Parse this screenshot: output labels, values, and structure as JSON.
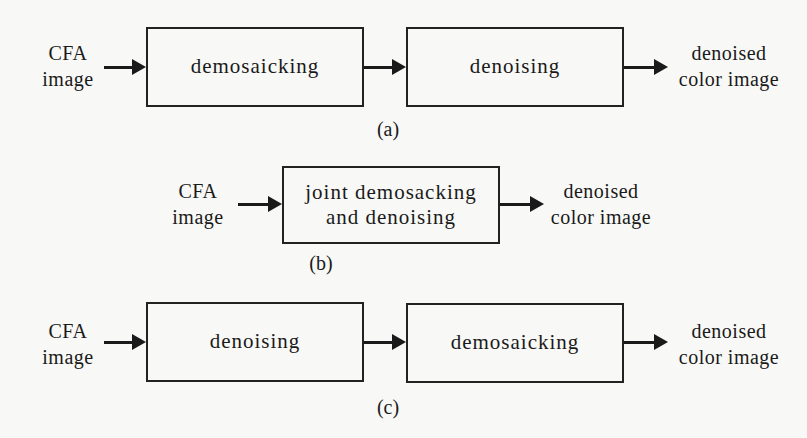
{
  "diagrams": {
    "a": {
      "input": {
        "line1": "CFA",
        "line2": "image"
      },
      "blocks": [
        "demosaicking",
        "denoising"
      ],
      "output": {
        "line1": "denoised",
        "line2": "color image"
      },
      "caption": "(a)"
    },
    "b": {
      "input": {
        "line1": "CFA",
        "line2": "image"
      },
      "blocks": [
        {
          "line1": "joint demosacking",
          "line2": "and denoising"
        }
      ],
      "output": {
        "line1": "denoised",
        "line2": "color image"
      },
      "caption": "(b)"
    },
    "c": {
      "input": {
        "line1": "CFA",
        "line2": "image"
      },
      "blocks": [
        "denoising",
        "demosaicking"
      ],
      "output": {
        "line1": "denoised",
        "line2": "color image"
      },
      "caption": "(c)"
    }
  },
  "colors": {
    "background": "#f8f8f6",
    "stroke": "#1a1a1a"
  }
}
